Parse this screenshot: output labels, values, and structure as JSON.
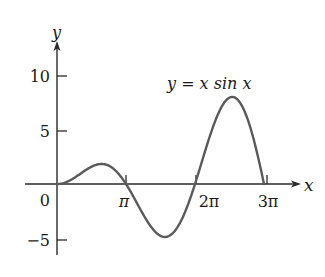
{
  "chart_data": {
    "type": "line",
    "title": "y = x sin x",
    "function": "y = x sin x",
    "xlabel": "x",
    "ylabel": "y",
    "x_ticks": [
      {
        "value": 3.14159,
        "label": "π"
      },
      {
        "value": 6.28319,
        "label": "2π"
      },
      {
        "value": 9.42478,
        "label": "3π"
      }
    ],
    "y_ticks": [
      {
        "value": -5,
        "label": "−5"
      },
      {
        "value": 0,
        "label": "0"
      },
      {
        "value": 5,
        "label": "5"
      },
      {
        "value": 10,
        "label": "10"
      }
    ],
    "xlim": [
      -1.4,
      11.2
    ],
    "ylim": [
      -6.5,
      13
    ],
    "x_domain": [
      0,
      9.42478
    ],
    "grid": false,
    "legend": "none",
    "annotations": [
      {
        "text": "y = x sin x",
        "x": 7.0,
        "y": 9.5
      }
    ],
    "key_points": [
      {
        "x": 0,
        "y": 0
      },
      {
        "x": 2.03,
        "y": 1.82
      },
      {
        "x": 3.14159,
        "y": 0
      },
      {
        "x": 4.91,
        "y": -4.81
      },
      {
        "x": 6.28319,
        "y": 0
      },
      {
        "x": 7.98,
        "y": 7.92
      },
      {
        "x": 9.42478,
        "y": 0
      }
    ],
    "series": [
      {
        "name": "x sin x",
        "color": "#5a5a5a",
        "x": [
          0,
          0.5,
          1.0,
          1.5,
          2.0,
          2.5,
          3.0,
          3.14159,
          3.5,
          4.0,
          4.5,
          5.0,
          5.5,
          6.0,
          6.28319,
          6.5,
          7.0,
          7.5,
          8.0,
          8.5,
          9.0,
          9.42478
        ],
        "values": [
          0,
          0.24,
          0.84,
          1.5,
          1.82,
          1.5,
          0.42,
          0,
          -1.23,
          -3.03,
          -4.4,
          -4.79,
          -3.89,
          -1.68,
          0,
          1.4,
          4.6,
          7.03,
          7.91,
          6.82,
          3.71,
          0
        ]
      }
    ]
  },
  "labels": {
    "y_axis": "y",
    "x_axis": "x",
    "equation": "y = x sin x",
    "tick_10": "10",
    "tick_5": "5",
    "tick_0": "0",
    "tick_m5": "−5",
    "tick_pi": "π",
    "tick_2pi": "2π",
    "tick_3pi": "3π"
  }
}
